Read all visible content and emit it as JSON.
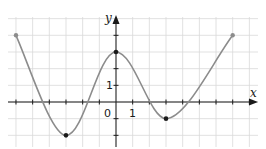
{
  "chart_data": {
    "type": "line",
    "title": "",
    "xlabel": "x",
    "ylabel": "y",
    "tick_labels": {
      "origin": "0",
      "x_unit": "1",
      "y_unit": "1"
    },
    "xlim": [
      -6.5,
      8.5
    ],
    "ylim": [
      -2.3,
      5.1
    ],
    "grid": true,
    "grid_step": 1,
    "series": [
      {
        "name": "f(x)",
        "color": "#8c8c8c",
        "key_points": [
          {
            "x": -6,
            "y": 4,
            "marker": "endpoint"
          },
          {
            "x": -3,
            "y": -2,
            "marker": "minimum"
          },
          {
            "x": 0,
            "y": 3,
            "marker": "maximum"
          },
          {
            "x": 3,
            "y": -1,
            "marker": "minimum"
          },
          {
            "x": 7,
            "y": 4,
            "marker": "endpoint"
          }
        ],
        "x": [
          -6,
          -5,
          -4.3,
          -4,
          -3,
          -2,
          -1.6,
          -1,
          0,
          1,
          1.7,
          2,
          3,
          4,
          4.1,
          5,
          6,
          7
        ],
        "y": [
          4,
          1.4,
          0,
          -0.8,
          -2,
          -0.9,
          0,
          1.6,
          3,
          1.6,
          0,
          -0.4,
          -1,
          -0.2,
          0,
          1.4,
          2.8,
          4
        ]
      }
    ]
  },
  "labels": {
    "x_axis": "x",
    "y_axis": "y",
    "origin": "0",
    "x_one": "1",
    "y_one": "1"
  },
  "colors": {
    "curve": "#8c8c8c",
    "axis": "#1a1a1a",
    "grid": "#d9d9d9",
    "point": "#1a1a1a"
  }
}
